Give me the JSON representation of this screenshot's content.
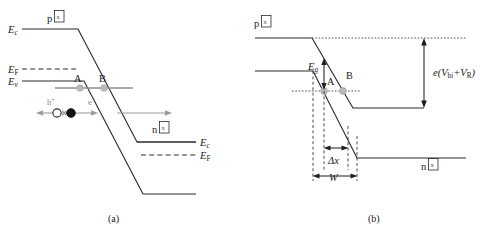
{
  "figure": {
    "panels": [
      {
        "id": "a",
        "caption": "(a)",
        "region_labels": {
          "p_side": "p",
          "p_side_glyph": "x",
          "n_side": "n",
          "n_side_glyph": "x"
        },
        "band_labels": {
          "ec_p": "E",
          "ec_p_sub": "c",
          "ef_p": "E",
          "ef_p_sub": "F",
          "ev_p": "E",
          "ev_p_sub": "v",
          "ec_n": "E",
          "ec_n_sub": "c",
          "ef_n": "E",
          "ef_n_sub": "F"
        },
        "trap_labels": {
          "trap_a": "A",
          "trap_b": "B"
        },
        "carriers": {
          "hole": "h",
          "hole_sup": "+",
          "electron": "e",
          "electron_sup": "−"
        }
      },
      {
        "id": "b",
        "caption": "(b)",
        "region_labels": {
          "p_side": "p",
          "p_side_glyph": "x",
          "n_side": "n",
          "n_side_glyph": "x"
        },
        "band_labels": {
          "eg": "E",
          "eg_sub": "g"
        },
        "trap_labels": {
          "trap_a": "A",
          "trap_b": "B"
        },
        "dimensions": {
          "delta_x": "Δx",
          "width": "W",
          "potential": "e(V",
          "potential_sub1": "bi",
          "potential_mid": "+V",
          "potential_sub2": "R",
          "potential_end": ")"
        }
      }
    ],
    "colors": {
      "band_stroke": "#2b2b2b",
      "trap_marker": "#b9b9b9",
      "carrier_arrow": "#9b9b9b",
      "guide": "#4a4a4a",
      "background": "#ffffff"
    }
  }
}
